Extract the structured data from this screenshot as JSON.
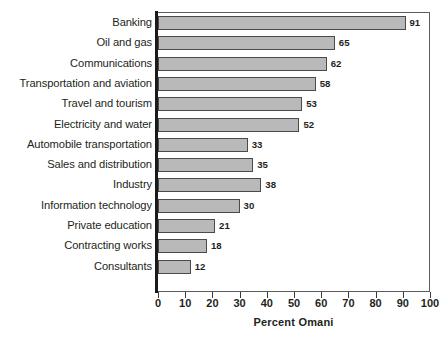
{
  "chart_data": {
    "type": "bar",
    "orientation": "horizontal",
    "title": "",
    "xlabel": "Percent Omani",
    "ylabel": "",
    "xlim": [
      0,
      100
    ],
    "xticks": [
      0,
      10,
      20,
      30,
      40,
      50,
      60,
      70,
      80,
      90,
      100
    ],
    "xtick_labels": [
      "0",
      "10",
      "20",
      "30",
      "40",
      "50",
      "60",
      "70",
      "80",
      "90",
      "100"
    ],
    "grid": false,
    "legend": false,
    "bar_color": "#b9b9b9",
    "bar_edge_color": "#4a4a4a",
    "categories": [
      "Banking",
      "Oil and gas",
      "Communications",
      "Transportation and aviation",
      "Travel and tourism",
      "Electricity and water",
      "Automobile transportation",
      "Sales and distribution",
      "Industry",
      "Information technology",
      "Private education",
      "Contracting works",
      "Consultants"
    ],
    "values": [
      91,
      65,
      62,
      58,
      53,
      52,
      33,
      35,
      38,
      30,
      21,
      18,
      12
    ],
    "value_labels": [
      "91",
      "65",
      "62",
      "58",
      "53",
      "52",
      "33",
      "35",
      "38",
      "30",
      "21",
      "18",
      "12"
    ]
  }
}
